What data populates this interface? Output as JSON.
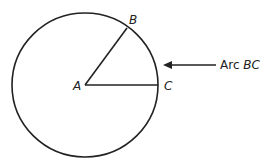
{
  "diagram": {
    "points": {
      "A": {
        "label": "A",
        "role": "center"
      },
      "B": {
        "label": "B",
        "role": "point on circle"
      },
      "C": {
        "label": "C",
        "role": "point on circle"
      }
    },
    "annotation": {
      "prefix": "Arc ",
      "arc_name": "BC"
    },
    "colors": {
      "stroke": "#222222",
      "background": "#ffffff"
    }
  }
}
